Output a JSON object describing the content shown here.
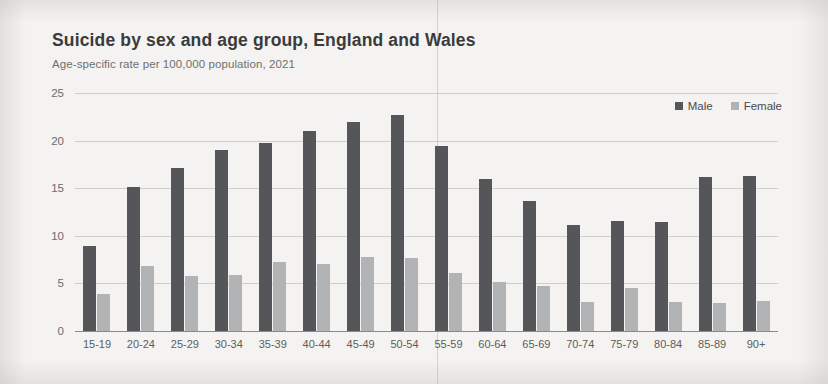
{
  "header": {
    "title": "Suicide by sex and age group, England and Wales",
    "subtitle": "Age-specific rate per 100,000 population, 2021"
  },
  "legend": {
    "position": "top-right",
    "items": [
      {
        "label": "Male",
        "color": "#55565a"
      },
      {
        "label": "Female",
        "color": "#b2b3b4"
      }
    ]
  },
  "axes": {
    "y_ticks": [
      "0",
      "5",
      "10",
      "15",
      "20",
      "25"
    ]
  },
  "chart_data": {
    "type": "bar",
    "title": "Suicide by sex and age group, England and Wales",
    "subtitle": "Age-specific rate per 100,000 population, 2021",
    "xlabel": "",
    "ylabel": "Age-specific rate per 100,000 population",
    "ylim": [
      0,
      25
    ],
    "yticks": [
      0,
      5,
      10,
      15,
      20,
      25
    ],
    "grid": true,
    "legend_position": "top-right",
    "categories": [
      "15-19",
      "20-24",
      "25-29",
      "30-34",
      "35-39",
      "40-44",
      "45-49",
      "50-54",
      "55-59",
      "60-64",
      "65-69",
      "70-74",
      "75-79",
      "80-84",
      "85-89",
      "90+"
    ],
    "series": [
      {
        "name": "Male",
        "color": "#55565a",
        "values": [
          8.9,
          15.1,
          17.1,
          19.0,
          19.8,
          21.0,
          22.0,
          22.7,
          19.4,
          16.0,
          13.7,
          11.1,
          11.6,
          11.5,
          16.2,
          16.3
        ]
      },
      {
        "name": "Female",
        "color": "#b2b3b4",
        "values": [
          3.9,
          6.8,
          5.8,
          5.9,
          7.3,
          7.0,
          7.8,
          7.7,
          6.1,
          5.2,
          4.7,
          3.1,
          4.5,
          3.0,
          2.9,
          3.2
        ]
      }
    ]
  }
}
